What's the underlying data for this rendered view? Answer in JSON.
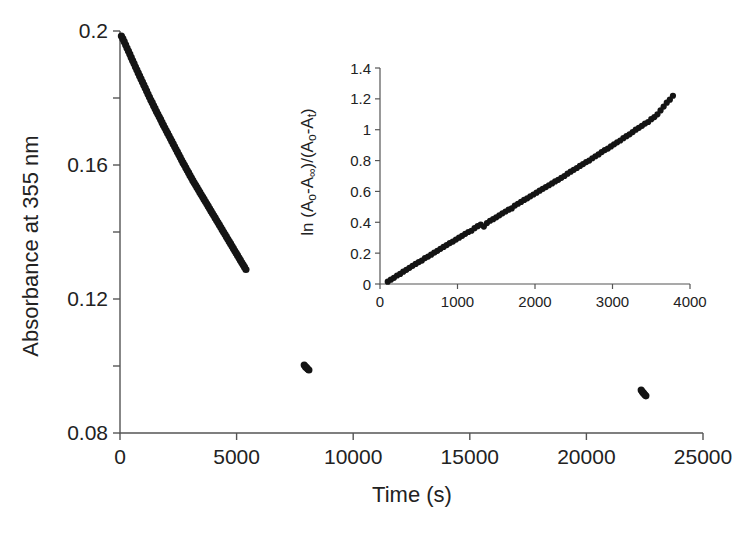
{
  "figure": {
    "background_color": "#ffffff",
    "marker_color": "#141414",
    "axis_color": "#555555",
    "text_color": "#222222"
  },
  "chart_data": [
    {
      "id": "main",
      "type": "scatter",
      "title": "",
      "xlabel": "Time (s)",
      "ylabel": "Absorbance at 355 nm",
      "xlim": [
        0,
        25000
      ],
      "ylim": [
        0.08,
        0.2
      ],
      "xticks": [
        0,
        5000,
        10000,
        15000,
        20000,
        25000
      ],
      "xtick_labels": [
        "0",
        "5000",
        "10000",
        "15000",
        "20000",
        "25000"
      ],
      "yticks": [
        0.08,
        0.1,
        0.12,
        0.14,
        0.16,
        0.18,
        0.2
      ],
      "ytick_labels": [
        "0.08",
        "",
        "0.12",
        "",
        "0.16",
        "",
        "0.2"
      ],
      "grid": false,
      "legend": null,
      "series": [
        {
          "name": "Absorbance decay",
          "marker": "filled-circle",
          "x": [
            60,
            120,
            180,
            240,
            300,
            360,
            420,
            480,
            540,
            600,
            660,
            720,
            780,
            840,
            900,
            960,
            1020,
            1080,
            1140,
            1200,
            1260,
            1320,
            1380,
            1440,
            1500,
            1560,
            1620,
            1680,
            1740,
            1800,
            1860,
            1920,
            1980,
            2040,
            2100,
            2160,
            2220,
            2280,
            2340,
            2400,
            2460,
            2520,
            2580,
            2640,
            2700,
            2760,
            2820,
            2880,
            2940,
            3000,
            3060,
            3120,
            3180,
            3240,
            3300,
            3360,
            3420,
            3480,
            3540,
            3600,
            3660,
            3720,
            3780,
            3840,
            3900,
            3960,
            4020,
            4080,
            4140,
            4200,
            4260,
            4320,
            4380,
            4440,
            4500,
            4560,
            4620,
            4680,
            4740,
            4800,
            4860,
            4920,
            4980,
            5040,
            5100,
            5160,
            5220,
            5280,
            5340,
            5400,
            7900,
            7950,
            8000,
            8050,
            8100,
            22350,
            22400,
            22450,
            22500,
            22550
          ],
          "y": [
            0.1985,
            0.1977,
            0.1968,
            0.1959,
            0.1949,
            0.194,
            0.1931,
            0.1921,
            0.1912,
            0.1903,
            0.1893,
            0.1884,
            0.1875,
            0.1866,
            0.1857,
            0.1848,
            0.1839,
            0.183,
            0.1821,
            0.1812,
            0.1803,
            0.1794,
            0.1786,
            0.1777,
            0.1769,
            0.176,
            0.1752,
            0.1744,
            0.1736,
            0.1727,
            0.1719,
            0.1711,
            0.1703,
            0.1695,
            0.1687,
            0.1679,
            0.1671,
            0.1663,
            0.1655,
            0.1647,
            0.1639,
            0.1631,
            0.1623,
            0.1615,
            0.1607,
            0.16,
            0.1592,
            0.1584,
            0.1577,
            0.1569,
            0.1562,
            0.1554,
            0.1547,
            0.154,
            0.1533,
            0.1526,
            0.1519,
            0.1512,
            0.1505,
            0.1498,
            0.1491,
            0.1484,
            0.1477,
            0.147,
            0.1463,
            0.1456,
            0.1449,
            0.1442,
            0.1435,
            0.1428,
            0.1421,
            0.1414,
            0.1407,
            0.14,
            0.1393,
            0.1386,
            0.1379,
            0.1372,
            0.1365,
            0.1358,
            0.1351,
            0.1344,
            0.1337,
            0.133,
            0.1323,
            0.1316,
            0.1309,
            0.1302,
            0.1295,
            0.1288,
            0.1003,
            0.0998,
            0.0995,
            0.0991,
            0.0988,
            0.0928,
            0.0923,
            0.0919,
            0.0915,
            0.0911
          ]
        }
      ]
    },
    {
      "id": "inset",
      "type": "scatter",
      "title": "",
      "xlabel": "",
      "ylabel": "ln (Ao-A∞)/(Ao-At)",
      "ylabel_parts": {
        "prefix": "ln (A",
        "sub1": "o",
        "mid1": "-A",
        "sub2": "∞",
        "mid2": ")/(A",
        "sub3": "o",
        "mid3": "-A",
        "sub4": "t",
        "suffix": ")"
      },
      "xlim": [
        0,
        4000
      ],
      "ylim": [
        0,
        1.4
      ],
      "xticks": [
        0,
        1000,
        2000,
        3000,
        4000
      ],
      "xtick_labels": [
        "0",
        "1000",
        "2000",
        "3000",
        "4000"
      ],
      "yticks": [
        0,
        0.2,
        0.4,
        0.6,
        0.8,
        1.0,
        1.2,
        1.4
      ],
      "ytick_labels": [
        "0",
        "0.2",
        "0.4",
        "0.6",
        "0.8",
        "1",
        "1.2",
        "1.4"
      ],
      "grid": false,
      "legend": null,
      "series": [
        {
          "name": "First-order kinetic plot",
          "marker": "filled-circle",
          "x": [
            100,
            140,
            180,
            220,
            260,
            300,
            340,
            380,
            420,
            460,
            500,
            540,
            580,
            620,
            660,
            700,
            740,
            780,
            820,
            860,
            900,
            940,
            980,
            1020,
            1060,
            1100,
            1140,
            1180,
            1220,
            1260,
            1300,
            1340,
            1380,
            1420,
            1460,
            1500,
            1540,
            1580,
            1620,
            1660,
            1700,
            1740,
            1780,
            1820,
            1860,
            1900,
            1940,
            1980,
            2020,
            2060,
            2100,
            2140,
            2180,
            2220,
            2260,
            2300,
            2340,
            2380,
            2420,
            2460,
            2500,
            2540,
            2580,
            2620,
            2660,
            2700,
            2740,
            2780,
            2820,
            2860,
            2900,
            2940,
            2980,
            3020,
            3060,
            3100,
            3140,
            3180,
            3220,
            3260,
            3300,
            3340,
            3380,
            3420,
            3460,
            3500,
            3540,
            3580,
            3620,
            3660,
            3700,
            3740,
            3780
          ],
          "y": [
            0.015,
            0.028,
            0.04,
            0.055,
            0.065,
            0.08,
            0.092,
            0.105,
            0.118,
            0.13,
            0.142,
            0.152,
            0.168,
            0.178,
            0.19,
            0.203,
            0.215,
            0.228,
            0.24,
            0.252,
            0.265,
            0.275,
            0.288,
            0.3,
            0.312,
            0.325,
            0.337,
            0.345,
            0.362,
            0.375,
            0.385,
            0.372,
            0.395,
            0.41,
            0.42,
            0.432,
            0.445,
            0.458,
            0.47,
            0.482,
            0.49,
            0.508,
            0.52,
            0.532,
            0.545,
            0.555,
            0.568,
            0.58,
            0.592,
            0.605,
            0.617,
            0.628,
            0.64,
            0.652,
            0.665,
            0.675,
            0.688,
            0.7,
            0.715,
            0.728,
            0.74,
            0.752,
            0.765,
            0.777,
            0.79,
            0.8,
            0.815,
            0.828,
            0.84,
            0.855,
            0.868,
            0.878,
            0.892,
            0.905,
            0.918,
            0.93,
            0.945,
            0.958,
            0.97,
            0.985,
            1.0,
            1.012,
            1.025,
            1.04,
            1.05,
            1.068,
            1.082,
            1.1,
            1.125,
            1.15,
            1.175,
            1.195,
            1.22
          ]
        }
      ]
    }
  ]
}
